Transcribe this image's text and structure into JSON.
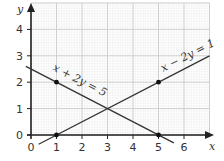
{
  "chart_data": {
    "type": "line",
    "title": "",
    "xlabel": "x",
    "ylabel": "y",
    "xlim": [
      0,
      7
    ],
    "ylim": [
      0,
      5
    ],
    "grid": true,
    "x_ticks": [
      "0",
      "1",
      "2",
      "3",
      "4",
      "5",
      "6"
    ],
    "y_ticks": [
      "0",
      "1",
      "2",
      "3",
      "4"
    ],
    "series": [
      {
        "name": "x + 2y = 5",
        "equation": "x + 2y = 5",
        "x": [
          -0.2,
          5.6
        ],
        "y": [
          2.6,
          -0.3
        ],
        "marked_points": [
          [
            1,
            2
          ],
          [
            5,
            0
          ]
        ]
      },
      {
        "name": "x − 2y = 1",
        "equation": "x − 2y = 1",
        "x": [
          0.3,
          7
        ],
        "y": [
          -0.35,
          3
        ],
        "marked_points": [
          [
            1,
            0
          ],
          [
            5,
            2
          ]
        ]
      }
    ],
    "intersection": [
      3,
      1
    ]
  },
  "labels": {
    "line1": "x + 2y = 5",
    "line2": "x − 2y = 1",
    "x_axis": "x",
    "y_axis": "y"
  },
  "colors": {
    "line": "#333333",
    "grid_major": "#cfcfcf",
    "grid_minor": "#ececec"
  }
}
